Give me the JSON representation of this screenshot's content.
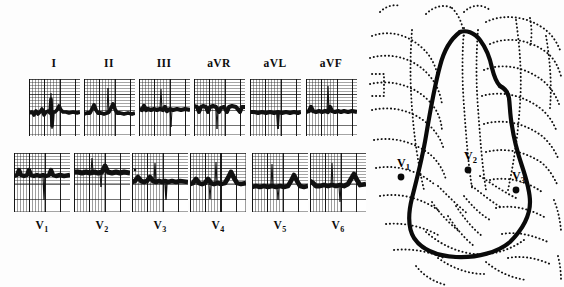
{
  "figure": {
    "background_color": "#fdfdfd",
    "ink_color": "#0c0c0c"
  },
  "ecg": {
    "panel_name": "12-lead electrocardiogram strips",
    "grid_small_mm": 1,
    "grid_large_mm": 5,
    "rows": [
      {
        "row_name": "limb-and-augmented-leads",
        "leads": [
          {
            "label": "I",
            "sub": ""
          },
          {
            "label": "II",
            "sub": ""
          },
          {
            "label": "III",
            "sub": ""
          },
          {
            "label": "aVR",
            "sub": ""
          },
          {
            "label": "aVL",
            "sub": ""
          },
          {
            "label": "aVF",
            "sub": ""
          }
        ]
      },
      {
        "row_name": "precordial-leads",
        "leads": [
          {
            "label": "V",
            "sub": "1"
          },
          {
            "label": "V",
            "sub": "2"
          },
          {
            "label": "V",
            "sub": "3"
          },
          {
            "label": "V",
            "sub": "4"
          },
          {
            "label": "V",
            "sub": "5"
          },
          {
            "label": "V",
            "sub": "6"
          }
        ]
      }
    ]
  },
  "chest_diagram": {
    "panel_name": "chest radiograph tracing with electrode positions",
    "silhouette_name": "cardiac-silhouette-outline",
    "ribs_name": "rib-and-lung-outlines",
    "electrodes": [
      {
        "label": "V",
        "sub": "1"
      },
      {
        "label": "V",
        "sub": "2"
      },
      {
        "label": "V",
        "sub": "3"
      }
    ]
  }
}
